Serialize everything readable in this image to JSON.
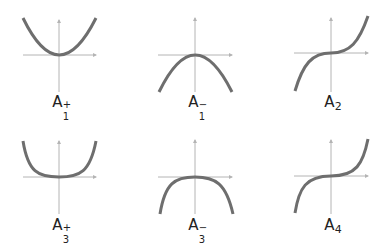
{
  "colors": {
    "curve": "#6e6e6e",
    "axis": "#b4b4b4",
    "label": "#222222"
  },
  "panels": [
    {
      "name": "A1+",
      "label": {
        "base": "A",
        "sub": "1",
        "sup": "+"
      },
      "function": "x^2"
    },
    {
      "name": "A1-",
      "label": {
        "base": "A",
        "sub": "1",
        "sup": "−"
      },
      "function": "-x^2"
    },
    {
      "name": "A2",
      "label": {
        "base": "A",
        "sub": "2",
        "sup": ""
      },
      "function": "x^3"
    },
    {
      "name": "A3+",
      "label": {
        "base": "A",
        "sub": "3",
        "sup": "+"
      },
      "function": "x^4"
    },
    {
      "name": "A3-",
      "label": {
        "base": "A",
        "sub": "3",
        "sup": "−"
      },
      "function": "-x^4"
    },
    {
      "name": "A4",
      "label": {
        "base": "A",
        "sub": "4",
        "sup": ""
      },
      "function": "x^5"
    }
  ]
}
